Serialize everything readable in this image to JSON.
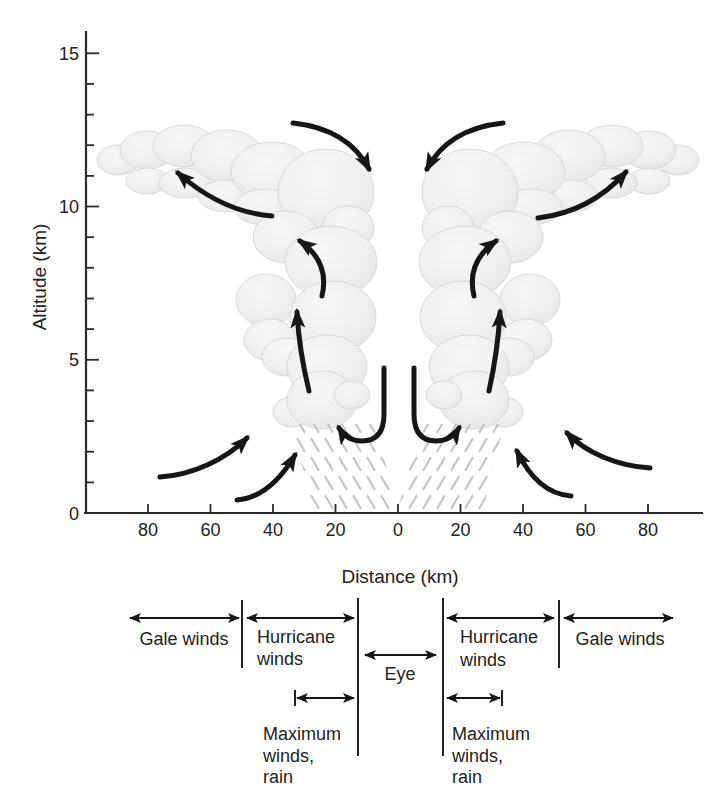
{
  "diagram_title": "Hurricane vertical cross-section",
  "colors": {
    "background": "#ffffff",
    "cloud_light": "#f6f6f6",
    "cloud_shade": "#dedede",
    "ink": "#1a1a1a",
    "rain_hatch": "#c6c6c6"
  },
  "axes": {
    "y": {
      "title": "Altitude (km)",
      "tick_labels": [
        "15",
        "10",
        "5",
        "0"
      ],
      "range_km": [
        0,
        15
      ],
      "minor_tick_km": 1,
      "major_tick_km": 5
    },
    "x": {
      "title": "Distance (km)",
      "tick_labels": [
        "80",
        "60",
        "40",
        "20",
        "0",
        "20",
        "40",
        "60",
        "80"
      ],
      "tick_step_km": 20,
      "range_km": [
        -100,
        100
      ]
    }
  },
  "legend": {
    "zones": [
      {
        "label": "Gale winds"
      },
      {
        "line1": "Hurricane",
        "line2": "winds"
      },
      {
        "label": "Eye"
      },
      {
        "line1": "Hurricane",
        "line2": "winds"
      },
      {
        "label": "Gale winds"
      }
    ],
    "max_winds": {
      "line1": "Maximum",
      "line2": "winds,",
      "line3": "rain"
    }
  }
}
